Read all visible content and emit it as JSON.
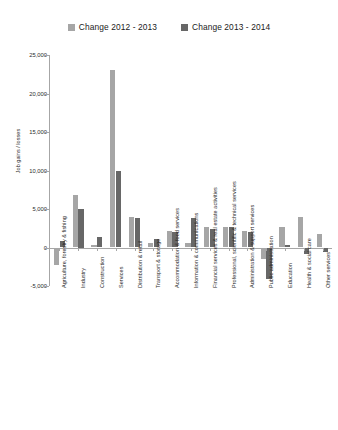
{
  "chart_data": {
    "type": "bar",
    "title": "",
    "xlabel": "",
    "ylabel": "Job gains / losses",
    "ylim": [
      -5000,
      25000
    ],
    "ytick_labels": [
      "25,000",
      "20,000",
      "15,000",
      "10,000",
      "5,000",
      "0",
      "-5,000"
    ],
    "ytick_values": [
      25000,
      20000,
      15000,
      10000,
      5000,
      0,
      -5000
    ],
    "grid": false,
    "legend_position": "top-center",
    "categories": [
      "Agriculture, forestry & fishing",
      "Industry",
      "Construction",
      "Services",
      "Distribution & retail",
      "Transport & storage",
      "Accommodation & food services",
      "Information & communications",
      "Financial services & real estate activities",
      "Professional, scientific & technical services",
      "Administration & support services",
      "Public administration",
      "Education",
      "Health & social care",
      "Other services"
    ],
    "series": [
      {
        "name": "Change 2012 - 2013",
        "color": "#a6a6a6",
        "values": [
          -2300,
          6800,
          300,
          23000,
          3900,
          600,
          2200,
          600,
          2700,
          2600,
          2200,
          -1500,
          2600,
          4000,
          1700
        ]
      },
      {
        "name": "Change 2013 - 2014",
        "color": "#676767",
        "values": [
          800,
          5000,
          1400,
          9900,
          3800,
          1100,
          2000,
          3800,
          2400,
          2600,
          2000,
          -4100,
          300,
          -800,
          -600
        ]
      }
    ]
  },
  "legend": {
    "items": [
      {
        "label": "Change 2012 - 2013",
        "color": "#a6a6a6"
      },
      {
        "label": "Change 2013 - 2014",
        "color": "#676767"
      }
    ]
  }
}
